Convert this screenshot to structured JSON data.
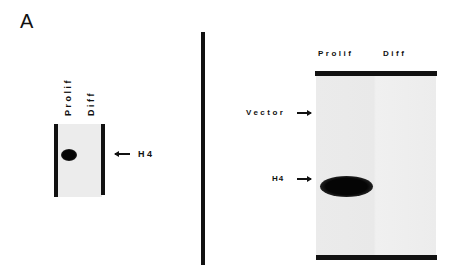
{
  "figure": {
    "panel_label": "A",
    "left_blot": {
      "lanes": [
        "Prolif",
        "Diff"
      ],
      "marker_label": "H4"
    },
    "right_blot": {
      "lanes": [
        "Prolif",
        "Diff"
      ],
      "markers": [
        "Vector",
        "H4"
      ]
    }
  }
}
